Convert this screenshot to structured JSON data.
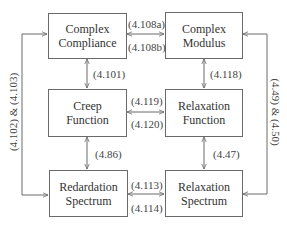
{
  "diagram": {
    "boxes": {
      "complex_compliance": {
        "line1": "Complex",
        "line2": "Compliance"
      },
      "complex_modulus": {
        "line1": "Complex",
        "line2": "Modulus"
      },
      "creep_function": {
        "line1": "Creep",
        "line2": "Function"
      },
      "relaxation_function": {
        "line1": "Relaxation",
        "line2": "Function"
      },
      "redardation_spectrum": {
        "line1": "Redardation",
        "line2": "Spectrum"
      },
      "relaxation_spectrum": {
        "line1": "Relaxation",
        "line2": "Spectrum"
      }
    },
    "edges": {
      "compliance_modulus_top": "(4.108a)",
      "compliance_modulus_bottom": "(4.108b)",
      "compliance_creep": "(4.101)",
      "modulus_relaxfn": "(4.118)",
      "creep_relaxfn_top": "(4.119)",
      "creep_relaxfn_bottom": "(4.120)",
      "creep_redardation": "(4.86)",
      "relaxfn_relaxspec": "(4.47)",
      "spectra_top": "(4.113)",
      "spectra_bottom": "(4.114)",
      "left_outer": "(4.102) & (4.103)",
      "right_outer": "(4.49) & (4.50)"
    },
    "colors": {
      "line": "#6a6a6a",
      "text": "#333333"
    }
  }
}
